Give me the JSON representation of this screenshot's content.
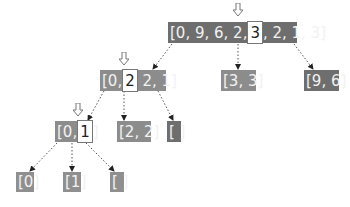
{
  "nodes": [
    {
      "id": "root",
      "before": "[0, 9, 6, 2,",
      "pivot": "3",
      "after": ", 2, 1, 3]",
      "style": "dark"
    },
    {
      "id": "n-left",
      "before": "[0,",
      "pivot": "2",
      "after": " 2, 1]",
      "style": "mid"
    },
    {
      "id": "n-mid",
      "label": "[3, 3]",
      "style": "mid"
    },
    {
      "id": "n-right",
      "label": "[9, 6]",
      "style": "dark"
    },
    {
      "id": "n-ll",
      "before": "[0,",
      "pivot": "1",
      "after": "]",
      "style": "mid"
    },
    {
      "id": "n-lm",
      "label": "[2, 2]",
      "style": "mid"
    },
    {
      "id": "n-lr",
      "label": "[ ]",
      "style": "dark"
    },
    {
      "id": "leaf-0",
      "label": "[0]",
      "style": "leaf"
    },
    {
      "id": "leaf-1",
      "label": "[1]",
      "style": "leaf"
    },
    {
      "id": "leaf-empty",
      "label": "[ ]",
      "style": "leaf"
    }
  ],
  "edges": [
    [
      "root",
      "n-left"
    ],
    [
      "root",
      "n-mid"
    ],
    [
      "root",
      "n-right"
    ],
    [
      "n-left",
      "n-ll"
    ],
    [
      "n-left",
      "n-lm"
    ],
    [
      "n-left",
      "n-lr"
    ],
    [
      "n-ll",
      "leaf-0"
    ],
    [
      "n-ll",
      "leaf-1"
    ],
    [
      "n-ll",
      "leaf-empty"
    ]
  ],
  "colors": {
    "dark": "#6e6e6e",
    "mid": "#8c8c8c",
    "edge": "#555555"
  }
}
